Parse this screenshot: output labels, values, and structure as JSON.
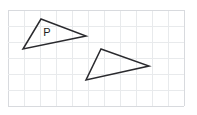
{
  "figure": {
    "canvas": {
      "width": 197,
      "height": 115
    },
    "background_color": "#ffffff"
  },
  "grid": {
    "cell_size": 16,
    "x_start": 8,
    "y_start": 10,
    "columns": 11,
    "rows": 6,
    "line_color": "#d8dade",
    "faint_line_color": "#e8eaec",
    "x_lines": [
      8,
      24,
      40,
      56,
      72,
      88,
      104,
      120,
      136,
      152,
      168,
      184
    ],
    "y_lines": [
      10,
      26,
      42,
      58,
      74,
      90,
      106
    ]
  },
  "shapes": [
    {
      "id": "triangle-p",
      "name": "Triangle P",
      "label": "P",
      "label_position": {
        "x": 47,
        "y": 33
      },
      "stroke_color": "#2a2a2e",
      "stroke_width": 1.5,
      "fill": "none",
      "points": "41,19 86,36 23,49",
      "vertices": [
        {
          "name": "top",
          "x": 41,
          "y": 19
        },
        {
          "name": "right",
          "x": 86,
          "y": 36
        },
        {
          "name": "left",
          "x": 23,
          "y": 49
        }
      ]
    },
    {
      "id": "triangle-image",
      "name": "Translated triangle",
      "label": "",
      "stroke_color": "#2a2a2e",
      "stroke_width": 1.5,
      "fill": "none",
      "points": "101,49 149,66 86,80",
      "vertices": [
        {
          "name": "top",
          "x": 101,
          "y": 49
        },
        {
          "name": "right",
          "x": 149,
          "y": 66
        },
        {
          "name": "left",
          "x": 86,
          "y": 80
        }
      ]
    }
  ]
}
